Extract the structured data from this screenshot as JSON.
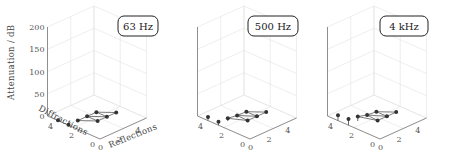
{
  "chart_data": {
    "type": "stem3d",
    "title": "",
    "zlabel": "Attenuation / dB",
    "xlabel": "Reflections",
    "ylabel": "Diffractions",
    "zlim": [
      0,
      200
    ],
    "z_ticks": [
      "0",
      "50",
      "100",
      "150",
      "200"
    ],
    "x_ticks": [
      "0",
      "2",
      "4"
    ],
    "y_ticks": [
      "0",
      "2",
      "4"
    ],
    "grid": true,
    "panels": [
      {
        "label": "63 Hz",
        "points": [
          {
            "reflections": 0,
            "diffractions": 4,
            "attenuation": 1
          },
          {
            "reflections": 0,
            "diffractions": 3,
            "attenuation": 1
          },
          {
            "reflections": 1,
            "diffractions": 3,
            "attenuation": 1
          },
          {
            "reflections": 2,
            "diffractions": 3,
            "attenuation": 1
          },
          {
            "reflections": 3,
            "diffractions": 3,
            "attenuation": 1
          },
          {
            "reflections": 2,
            "diffractions": 2,
            "attenuation": 1
          },
          {
            "reflections": 3,
            "diffractions": 2,
            "attenuation": 1
          },
          {
            "reflections": 4,
            "diffractions": 2,
            "attenuation": 1
          }
        ]
      },
      {
        "label": "500 Hz",
        "points": [
          {
            "reflections": 0,
            "diffractions": 4,
            "attenuation": 8
          },
          {
            "reflections": 0,
            "diffractions": 3,
            "attenuation": 8
          },
          {
            "reflections": 1,
            "diffractions": 3,
            "attenuation": 6
          },
          {
            "reflections": 2,
            "diffractions": 3,
            "attenuation": 3
          },
          {
            "reflections": 3,
            "diffractions": 3,
            "attenuation": 2
          },
          {
            "reflections": 2,
            "diffractions": 2,
            "attenuation": 2
          },
          {
            "reflections": 3,
            "diffractions": 2,
            "attenuation": 2
          },
          {
            "reflections": 4,
            "diffractions": 2,
            "attenuation": 2
          }
        ]
      },
      {
        "label": "4 kHz",
        "points": [
          {
            "reflections": 0,
            "diffractions": 4,
            "attenuation": 12
          },
          {
            "reflections": 0,
            "diffractions": 3,
            "attenuation": 14
          },
          {
            "reflections": 1,
            "diffractions": 3,
            "attenuation": 10
          },
          {
            "reflections": 2,
            "diffractions": 3,
            "attenuation": 4
          },
          {
            "reflections": 3,
            "diffractions": 3,
            "attenuation": 2
          },
          {
            "reflections": 2,
            "diffractions": 2,
            "attenuation": 2
          },
          {
            "reflections": 3,
            "diffractions": 2,
            "attenuation": 2
          },
          {
            "reflections": 4,
            "diffractions": 2,
            "attenuation": 2
          }
        ]
      }
    ]
  },
  "colors": {
    "marker": "#333333",
    "stem": "#444444",
    "grid": "#e3e3e3",
    "axis": "#666666",
    "badge_border": "#222222"
  }
}
